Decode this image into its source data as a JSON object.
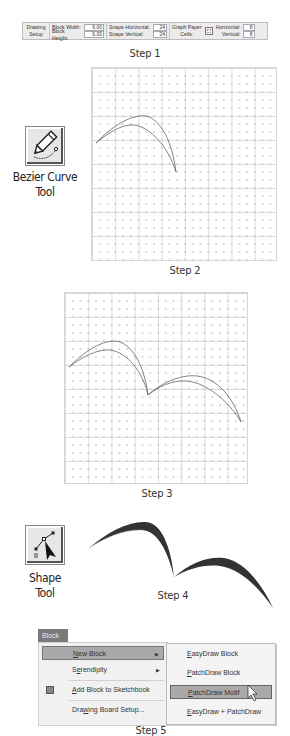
{
  "step1": {
    "caption": "Step 1",
    "toolbar": {
      "drawing_setup": [
        "Drawing",
        "Setup"
      ],
      "block_width_label": "Block Width:",
      "block_width_value": "6.00",
      "block_height_label": "Block Height:",
      "block_height_value": "6.00",
      "snaps_horizontal_label": "Snaps Horizontal:",
      "snaps_horizontal_value": "24",
      "snaps_vertical_label": "Snaps Vertical:",
      "snaps_vertical_value": "24",
      "graph_paper_label": [
        "Graph Paper",
        "Cells:"
      ],
      "horizontal_label": "Horizontal:",
      "horizontal_value": "8",
      "vertical_label": "Vertical:",
      "vertical_value": "8"
    }
  },
  "step2": {
    "caption": "Step 2",
    "tool_label_line1": "Bezier Curve",
    "tool_label_line2": "Tool",
    "tool_icon": "pencil-bezier-icon"
  },
  "step3": {
    "caption": "Step 3"
  },
  "step4": {
    "caption": "Step 4",
    "tool_label_line1": "Shape",
    "tool_label_line2": "Tool",
    "tool_icon": "shape-arrow-icon",
    "fill_color": "#333333"
  },
  "step5": {
    "caption": "Step 5",
    "menu_title": "Block",
    "menu_items": [
      {
        "pre": "",
        "u": "N",
        "post": "ew Block",
        "has_submenu": true,
        "highlighted": true
      },
      {
        "pre": "S",
        "u": "e",
        "post": "rendipity",
        "has_submenu": true,
        "highlighted": false
      },
      {
        "pre": "",
        "u": "A",
        "post": "dd Block to Sketchbook",
        "has_submenu": false,
        "highlighted": false
      },
      {
        "pre": "Dra",
        "u": "w",
        "post": "ing Board Setup...",
        "has_submenu": false,
        "highlighted": false
      }
    ],
    "submenu_items": [
      {
        "u": "E",
        "post": "asyDraw Block",
        "highlighted": false
      },
      {
        "u": "P",
        "post": "atchDraw Block",
        "highlighted": false
      },
      {
        "u": "P",
        "post": "atchDraw Motif",
        "highlighted": true
      },
      {
        "u": "E",
        "post": "asyDraw + PatchDraw",
        "highlighted": false
      }
    ],
    "highlight_color": "#a9a9a9"
  }
}
